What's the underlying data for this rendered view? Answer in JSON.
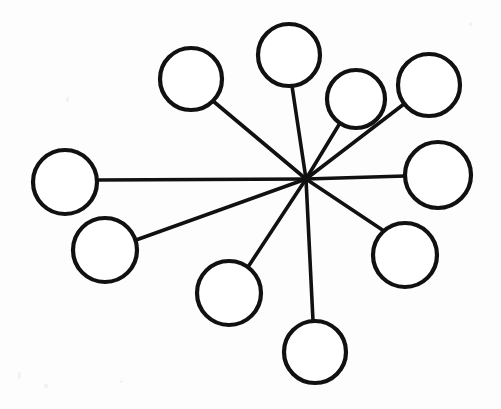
{
  "figure": {
    "name": "star-network-diagram",
    "background_color": "#fdfdfd",
    "stroke_color": "#111111",
    "node_fill_color": "#ffffff",
    "canvas": {
      "width": 501,
      "height": 409
    }
  },
  "chart_data": {
    "type": "diagram",
    "layout": "star",
    "title": "",
    "xlabel": "",
    "ylabel": "",
    "grid": false,
    "legend": null,
    "hub": {
      "id": "hub",
      "label": "",
      "x": 306,
      "y": 179,
      "degree": 10
    },
    "node_count": 10,
    "edge_count": 10,
    "nodes": [
      {
        "id": "n1",
        "label": "",
        "x": 191,
        "y": 79,
        "r": 31,
        "stroke_width": 4.2
      },
      {
        "id": "n2",
        "label": "",
        "x": 289,
        "y": 55,
        "r": 31,
        "stroke_width": 4.2
      },
      {
        "id": "n3",
        "label": "",
        "x": 356,
        "y": 99,
        "r": 29,
        "stroke_width": 4.2
      },
      {
        "id": "n4",
        "label": "",
        "x": 429,
        "y": 85,
        "r": 31,
        "stroke_width": 4.2
      },
      {
        "id": "n5",
        "label": "",
        "x": 438,
        "y": 175,
        "r": 33,
        "stroke_width": 4.2
      },
      {
        "id": "n6",
        "label": "",
        "x": 405,
        "y": 255,
        "r": 32,
        "stroke_width": 4.2
      },
      {
        "id": "n7",
        "label": "",
        "x": 315,
        "y": 352,
        "r": 31,
        "stroke_width": 4.2
      },
      {
        "id": "n8",
        "label": "",
        "x": 229,
        "y": 293,
        "r": 32,
        "stroke_width": 4.2
      },
      {
        "id": "n9",
        "label": "",
        "x": 105,
        "y": 250,
        "r": 32,
        "stroke_width": 4.2
      },
      {
        "id": "n10",
        "label": "",
        "x": 65,
        "y": 182,
        "r": 32,
        "stroke_width": 4.2
      }
    ],
    "edges": [
      {
        "id": "e1",
        "source": "hub",
        "target": "n1",
        "x1": 306,
        "y1": 179,
        "x2": 213,
        "y2": 101
      },
      {
        "id": "e2",
        "source": "hub",
        "target": "n2",
        "x1": 306,
        "y1": 179,
        "x2": 292,
        "y2": 86
      },
      {
        "id": "e3",
        "source": "hub",
        "target": "n3",
        "x1": 306,
        "y1": 179,
        "x2": 340,
        "y2": 123
      },
      {
        "id": "e4",
        "source": "hub",
        "target": "n4",
        "x1": 306,
        "y1": 179,
        "x2": 404,
        "y2": 104
      },
      {
        "id": "e5",
        "source": "hub",
        "target": "n5",
        "x1": 306,
        "y1": 179,
        "x2": 405,
        "y2": 176
      },
      {
        "id": "e6",
        "source": "hub",
        "target": "n6",
        "x1": 306,
        "y1": 179,
        "x2": 384,
        "y2": 231
      },
      {
        "id": "e7",
        "source": "hub",
        "target": "n7",
        "x1": 306,
        "y1": 179,
        "x2": 313,
        "y2": 321
      },
      {
        "id": "e8",
        "source": "hub",
        "target": "n8",
        "x1": 306,
        "y1": 179,
        "x2": 248,
        "y2": 267
      },
      {
        "id": "e9",
        "source": "hub",
        "target": "n9",
        "x1": 306,
        "y1": 179,
        "x2": 136,
        "y2": 240
      },
      {
        "id": "e10",
        "source": "hub",
        "target": "n10",
        "x1": 306,
        "y1": 179,
        "x2": 97,
        "y2": 180
      }
    ],
    "specks": [
      {
        "x": 18,
        "y": 372,
        "w": 3,
        "h": 7
      },
      {
        "x": 44,
        "y": 384,
        "w": 4,
        "h": 4
      },
      {
        "x": 66,
        "y": 97,
        "w": 3,
        "h": 5
      },
      {
        "x": 120,
        "y": 380,
        "w": 3,
        "h": 3
      },
      {
        "x": 469,
        "y": 22,
        "w": 3,
        "h": 4
      }
    ]
  }
}
